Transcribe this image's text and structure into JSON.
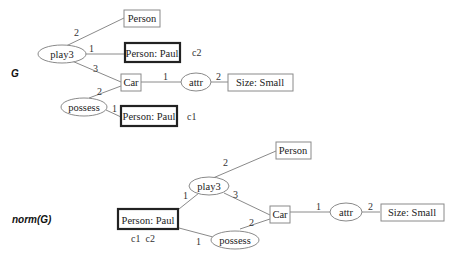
{
  "graphs": [
    {
      "title": "G",
      "concepts": [
        {
          "id": "person",
          "label": "Person",
          "bold": false
        },
        {
          "id": "paul_c2",
          "label": "Person: Paul",
          "bold": true,
          "coref": "c2"
        },
        {
          "id": "car",
          "label": "Car",
          "bold": false
        },
        {
          "id": "size",
          "label": "Size: Small",
          "bold": false
        },
        {
          "id": "paul_c1",
          "label": "Person: Paul",
          "bold": true,
          "coref": "c1"
        }
      ],
      "relations": [
        {
          "id": "play3",
          "label": "play3"
        },
        {
          "id": "attr",
          "label": "attr"
        },
        {
          "id": "possess",
          "label": "possess"
        }
      ],
      "edges": [
        {
          "from": "play3",
          "to": "person",
          "arg": "2"
        },
        {
          "from": "play3",
          "to": "paul_c2",
          "arg": "1"
        },
        {
          "from": "play3",
          "to": "car",
          "arg": "3"
        },
        {
          "from": "car",
          "to": "attr",
          "arg": "1"
        },
        {
          "from": "attr",
          "to": "size",
          "arg": "2"
        },
        {
          "from": "possess",
          "to": "car",
          "arg": "2"
        },
        {
          "from": "possess",
          "to": "paul_c1",
          "arg": "1"
        }
      ]
    },
    {
      "title": "norm(G)",
      "concepts": [
        {
          "id": "person",
          "label": "Person",
          "bold": false
        },
        {
          "id": "paul",
          "label": "Person: Paul",
          "bold": true,
          "coref": "c1  c2"
        },
        {
          "id": "car",
          "label": "Car",
          "bold": false
        },
        {
          "id": "size",
          "label": "Size: Small",
          "bold": false
        }
      ],
      "relations": [
        {
          "id": "play3",
          "label": "play3"
        },
        {
          "id": "attr",
          "label": "attr"
        },
        {
          "id": "possess",
          "label": "possess"
        }
      ],
      "edges": [
        {
          "from": "play3",
          "to": "person",
          "arg": "2"
        },
        {
          "from": "play3",
          "to": "paul",
          "arg": "1"
        },
        {
          "from": "play3",
          "to": "car",
          "arg": "3"
        },
        {
          "from": "car",
          "to": "attr",
          "arg": "1"
        },
        {
          "from": "attr",
          "to": "size",
          "arg": "2"
        },
        {
          "from": "possess",
          "to": "car",
          "arg": "2"
        },
        {
          "from": "possess",
          "to": "paul",
          "arg": "1"
        }
      ]
    }
  ]
}
